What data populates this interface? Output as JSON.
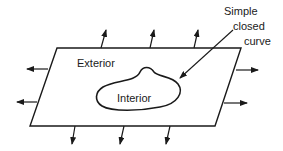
{
  "diagram": {
    "labels": {
      "exterior": "Exterior",
      "interior": "Interior",
      "curve_line1": "Simple",
      "curve_line2": "closed",
      "curve_line3": "curve"
    },
    "colors": {
      "stroke": "#1a1a1a",
      "background": "#ffffff"
    }
  }
}
